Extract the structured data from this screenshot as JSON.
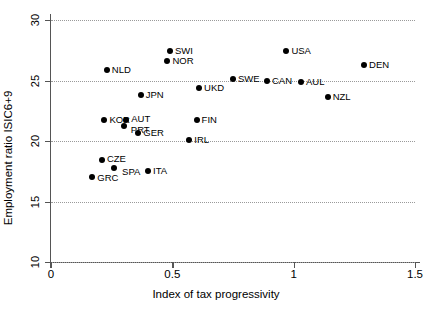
{
  "chart_data": {
    "type": "scatter",
    "title": "",
    "xlabel": "Index of tax progressivity",
    "ylabel": "Employment ratio ISIC6+9",
    "xlim": [
      0,
      1.5
    ],
    "ylim": [
      10,
      30
    ],
    "xticks": [
      "0",
      "0.5",
      "1",
      "1.5"
    ],
    "xtick_values": [
      0,
      0.5,
      1,
      1.5
    ],
    "yticks": [
      "10",
      "15",
      "20",
      "25",
      "30"
    ],
    "ytick_values": [
      10,
      15,
      20,
      25,
      30
    ],
    "grid": "horizontal dotted gridlines at each y tick",
    "legend": "none",
    "marker": "filled black circle",
    "points": [
      {
        "label": "SWI",
        "x": 0.49,
        "y": 27.4
      },
      {
        "label": "NOR",
        "x": 0.48,
        "y": 26.6
      },
      {
        "label": "NLD",
        "x": 0.23,
        "y": 25.9
      },
      {
        "label": "USA",
        "x": 0.97,
        "y": 27.4
      },
      {
        "label": "DEN",
        "x": 1.29,
        "y": 26.3
      },
      {
        "label": "SWE",
        "x": 0.75,
        "y": 25.1
      },
      {
        "label": "CAN",
        "x": 0.89,
        "y": 25.0
      },
      {
        "label": "AUL",
        "x": 1.03,
        "y": 24.9
      },
      {
        "label": "UKD",
        "x": 0.61,
        "y": 24.4
      },
      {
        "label": "JPN",
        "x": 0.37,
        "y": 23.8
      },
      {
        "label": "NZL",
        "x": 1.14,
        "y": 23.6
      },
      {
        "label": "KOR",
        "x": 0.22,
        "y": 21.7
      },
      {
        "label": "AUT",
        "x": 0.31,
        "y": 21.7
      },
      {
        "label": "PRT",
        "x": 0.3,
        "y": 21.2
      },
      {
        "label": "FIN",
        "x": 0.6,
        "y": 21.7
      },
      {
        "label": "GER",
        "x": 0.36,
        "y": 20.7
      },
      {
        "label": "IRL",
        "x": 0.57,
        "y": 20.1
      },
      {
        "label": "CZE",
        "x": 0.21,
        "y": 18.4
      },
      {
        "label": "SPA",
        "x": 0.26,
        "y": 17.8
      },
      {
        "label": "ITA",
        "x": 0.4,
        "y": 17.5
      },
      {
        "label": "GRC",
        "x": 0.17,
        "y": 17.0
      }
    ]
  }
}
